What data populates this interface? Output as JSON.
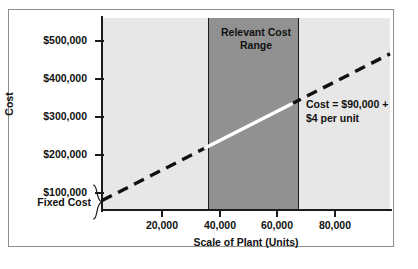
{
  "figure": {
    "background_color": "#ffffff",
    "frame_color": "#8f8f8f"
  },
  "chart_data": {
    "type": "line",
    "title": "",
    "xlabel": "Scale of Plant (Units)",
    "ylabel": "Cost",
    "xlim": [
      0,
      95000
    ],
    "ylim": [
      0,
      545000
    ],
    "grid": false,
    "legend": "none",
    "x_ticks": [
      20000,
      40000,
      60000,
      80000
    ],
    "x_tick_labels": [
      "20,000",
      "40,000",
      "60,000",
      "80,000"
    ],
    "y_ticks": [
      100000,
      200000,
      300000,
      400000,
      500000
    ],
    "y_tick_labels": [
      "$100,000",
      "$200,000",
      "$300,000",
      "$400,000",
      "$500,000"
    ],
    "series": [
      {
        "name": "Total Cost",
        "equation": "Cost = $90,000 + $4 per unit",
        "intercept": 90000,
        "slope_per_unit": 4,
        "x": [
          0,
          35000,
          65000,
          95000
        ],
        "y": [
          90000,
          230000,
          350000,
          470000
        ],
        "style": "dashed outside relevant range, solid white inside"
      }
    ],
    "shaded_regions": [
      {
        "name": "plot-background",
        "x_range": [
          0,
          95000
        ],
        "color": "#e7e7e7"
      },
      {
        "name": "relevant-cost-range",
        "label": "Relevant Cost\nRange",
        "x_range": [
          35000,
          65000
        ],
        "color": "#919191"
      }
    ],
    "annotations": [
      {
        "name": "relevant-cost-range-label",
        "line1": "Relevant Cost",
        "line2": "Range"
      },
      {
        "name": "equation-annotation",
        "line1": "Cost = $90,000 +",
        "line2": "$4 per unit"
      },
      {
        "name": "fixed-cost-callout",
        "text": "Fixed Cost",
        "value": 90000
      }
    ]
  },
  "labels": {
    "y_axis_title": "Cost",
    "x_axis_title": "Scale of Plant (Units)",
    "fixed_cost": "Fixed Cost",
    "relevant_range_line1": "Relevant Cost",
    "relevant_range_line2": "Range",
    "equation_line1": "Cost = $90,000 +",
    "equation_line2": "$4 per unit",
    "y_tick_0": "$100,000",
    "y_tick_1": "$200,000",
    "y_tick_2": "$300,000",
    "y_tick_3": "$400,000",
    "y_tick_4": "$500,000",
    "x_tick_0": "20,000",
    "x_tick_1": "40,000",
    "x_tick_2": "60,000",
    "x_tick_3": "80,000"
  }
}
